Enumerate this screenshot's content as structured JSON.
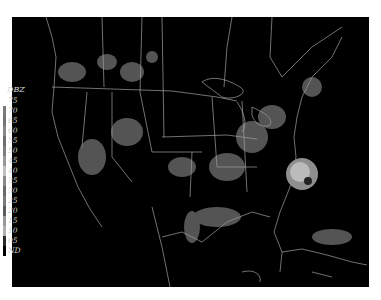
{
  "map": {
    "type": "radar-reflectivity",
    "region": "Contiguous United States",
    "background_color": "#000000",
    "border_color": "#cfcfcf"
  },
  "legend": {
    "title": "DBZ",
    "entries": [
      {
        "label": "75",
        "color": "#ffffff"
      },
      {
        "label": "70",
        "color": "#7a7a7a"
      },
      {
        "label": "65",
        "color": "#747474"
      },
      {
        "label": "60",
        "color": "#888888"
      },
      {
        "label": "55",
        "color": "#6e6e6e"
      },
      {
        "label": "50",
        "color": "#7e7e7e"
      },
      {
        "label": "45",
        "color": "#999999"
      },
      {
        "label": "40",
        "color": "#c0c0c0"
      },
      {
        "label": "35",
        "color": "#8a8a8a"
      },
      {
        "label": "30",
        "color": "#6a6a6a"
      },
      {
        "label": "25",
        "color": "#7a7a7a"
      },
      {
        "label": "20",
        "color": "#5c5c5c"
      },
      {
        "label": "15",
        "color": "#9a9a9a"
      },
      {
        "label": "10",
        "color": "#b0b0b0"
      },
      {
        "label": "05",
        "color": "#2a2a2a"
      },
      {
        "label": "ND",
        "color": "#000000"
      }
    ]
  },
  "features": {
    "storm": {
      "name": "hurricane-echo",
      "cx": 290,
      "cy": 155
    }
  }
}
